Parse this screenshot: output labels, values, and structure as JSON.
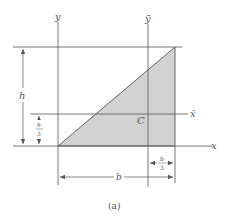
{
  "figure": {
    "caption": "(a)",
    "colors": {
      "fill": "#d2d2d2",
      "line": "#555555",
      "background": "#ffffff"
    }
  },
  "axes": {
    "y_label": "y",
    "y_bar_label": "ȳ",
    "x_label": "x",
    "x_bar_label": "x̄"
  },
  "shape": {
    "type": "right triangle",
    "centroid_label": "C"
  },
  "dimensions": {
    "height": "h",
    "height_third_num": "h",
    "height_third_den": "3",
    "base": "b",
    "base_third_num": "b",
    "base_third_den": "3"
  }
}
